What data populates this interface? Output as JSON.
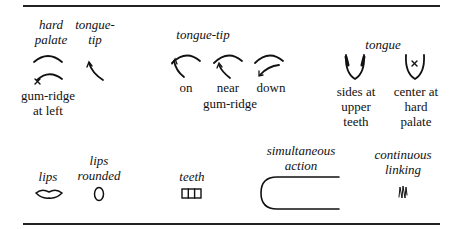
{
  "symbols": {
    "hard_palate": {
      "label": "hard palate",
      "lines": [
        "hard",
        "palate"
      ],
      "icon": "hard-palate-arc"
    },
    "gum_ridge_at_left": {
      "lines": [
        "gum-ridge",
        "at left"
      ],
      "icon": "arc-with-x-at-left"
    },
    "tongue_tip": {
      "lines": [
        "tongue-",
        "tip"
      ],
      "icon": "tongue-tip-arrow"
    },
    "tongue_tip_group": {
      "heading": "tongue-tip",
      "items": [
        {
          "label": "on",
          "icon": "tongue-tip-on-arc"
        },
        {
          "label": "near",
          "icon": "tongue-tip-near-arc"
        },
        {
          "label": "down",
          "icon": "tongue-tip-down-arc"
        }
      ],
      "footer": "gum-ridge"
    },
    "tongue_group": {
      "heading": "tongue",
      "items": [
        {
          "lines": [
            "sides at",
            "upper",
            "teeth"
          ],
          "icon": "tongue-sides-u"
        },
        {
          "lines": [
            "center at",
            "hard",
            "palate"
          ],
          "icon": "tongue-center-u-x"
        }
      ]
    },
    "lips": {
      "label": "lips",
      "icon": "lips-shape"
    },
    "lips_rounded": {
      "lines": [
        "lips",
        "rounded"
      ],
      "icon": "oval"
    },
    "teeth": {
      "label": "teeth",
      "icon": "teeth-grid"
    },
    "simultaneous_action": {
      "lines": [
        "simultaneous",
        "action"
      ],
      "icon": "bracket-curve"
    },
    "continuous_linking": {
      "lines": [
        "continuous",
        "linking"
      ],
      "icon": "zigzag-wave"
    }
  }
}
